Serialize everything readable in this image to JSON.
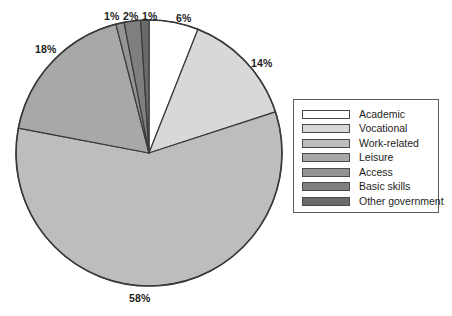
{
  "chart_data": {
    "type": "pie",
    "title": "",
    "labels": [
      "Academic",
      "Vocational",
      "Work-related",
      "Leisure",
      "Access",
      "Basic skills",
      "Other government"
    ],
    "values": [
      6,
      14,
      58,
      18,
      1,
      2,
      1
    ],
    "value_labels": [
      "6%",
      "14%",
      "58%",
      "18%",
      "1%",
      "2%",
      "1%"
    ],
    "colors": [
      "#ffffff",
      "#d8d8d8",
      "#bdbdbd",
      "#a8a8a8",
      "#949494",
      "#7f7f7f",
      "#6a6a6a"
    ],
    "slice_order": "clockwise-from-top",
    "legend": {
      "position": "right",
      "entries": [
        {
          "label": "Academic",
          "color": "#ffffff"
        },
        {
          "label": "Vocational",
          "color": "#d8d8d8"
        },
        {
          "label": "Work-related",
          "color": "#bdbdbd"
        },
        {
          "label": "Leisure",
          "color": "#a8a8a8"
        },
        {
          "label": "Access",
          "color": "#949494"
        },
        {
          "label": "Basic skills",
          "color": "#7f7f7f"
        },
        {
          "label": "Other government",
          "color": "#6a6a6a"
        }
      ]
    },
    "grid": false,
    "xlabel": "",
    "ylabel": ""
  },
  "pie": {
    "center_x": 149,
    "center_y": 153,
    "radius": 133,
    "outline_color": "#3a3a3a"
  },
  "pct_labels": [
    {
      "text": "1%",
      "left": 104,
      "top": 11
    },
    {
      "text": "2%",
      "left": 123,
      "top": 11
    },
    {
      "text": "1%",
      "left": 142,
      "top": 11
    },
    {
      "text": "6%",
      "left": 176,
      "top": 13
    },
    {
      "text": "14%",
      "left": 251,
      "top": 58
    },
    {
      "text": "18%",
      "left": 35,
      "top": 44
    },
    {
      "text": "58%",
      "left": 129,
      "top": 293
    }
  ]
}
